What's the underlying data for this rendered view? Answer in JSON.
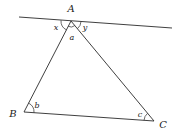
{
  "diagram": {
    "stroke_color": "#2a2a2a",
    "line": {
      "from": [
        19,
        17
      ],
      "to": [
        172,
        28
      ]
    },
    "vertices": {
      "A": {
        "label": "A",
        "point": [
          71,
          21
        ],
        "label_pos": [
          71,
          12
        ]
      },
      "B": {
        "label": "B",
        "point": [
          24,
          112
        ],
        "label_pos": [
          13,
          117
        ]
      },
      "C": {
        "label": "C",
        "point": [
          154,
          121
        ],
        "label_pos": [
          163,
          128
        ]
      }
    },
    "angles": {
      "x": {
        "label": "x",
        "label_pos": [
          56,
          30
        ]
      },
      "y": {
        "label": "y",
        "label_pos": [
          85,
          30
        ]
      },
      "a": {
        "label": "a",
        "label_pos": [
          72,
          40
        ]
      },
      "b": {
        "label": "b",
        "label_pos": [
          37,
          108
        ]
      },
      "c": {
        "label": "c",
        "label_pos": [
          140,
          117
        ]
      }
    }
  }
}
